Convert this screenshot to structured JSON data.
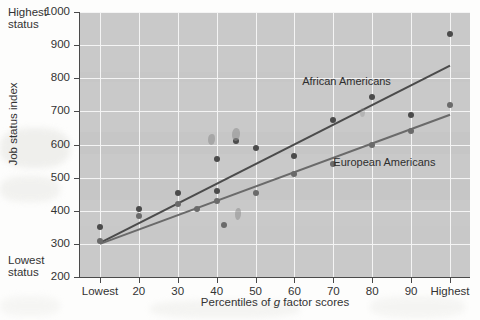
{
  "chart_data": {
    "type": "scatter",
    "title": "",
    "xlabel": "Percentiles of g factor scores",
    "xlabel_plain": "Percentiles of ",
    "xlabel_italic": "g",
    "xlabel_tail": " factor scores",
    "ylabel": "Job status index",
    "y_axis_top_note": "Highest status",
    "y_axis_bottom_note": "Lowest status",
    "y_axis_top_note_line1": "Highest",
    "y_axis_top_note_line2": "status",
    "y_axis_bottom_note_line1": "Lowest",
    "y_axis_bottom_note_line2": "status",
    "ylim": [
      200,
      1000
    ],
    "yticks": [
      200,
      300,
      400,
      500,
      600,
      700,
      800,
      900,
      1000
    ],
    "ytick_labels": [
      "200",
      "300",
      "400",
      "500",
      "600",
      "700",
      "800",
      "900",
      "1000"
    ],
    "categories": [
      "Lowest",
      "20",
      "30",
      "40",
      "50",
      "60",
      "70",
      "80",
      "90",
      "Highest"
    ],
    "xtick_labels": [
      "Lowest",
      "20",
      "30",
      "40",
      "50",
      "60",
      "70",
      "80",
      "90",
      "Highest"
    ],
    "grid": true,
    "grid_color": "#f4f4f4",
    "plot_background": "#c9c9c9",
    "legend_position": "inline-annotations",
    "series": [
      {
        "name": "African Americans",
        "label": "African Americans",
        "color": "#4b4b4b",
        "annotation_x_percentile": 62,
        "annotation_y_value": 790,
        "points": [
          {
            "x": "Lowest",
            "y": 352
          },
          {
            "x": "20",
            "y": 405
          },
          {
            "x": "30",
            "y": 455
          },
          {
            "x": "40",
            "y": 460
          },
          {
            "x": "40",
            "y": 555
          },
          {
            "x": "45",
            "y": 610
          },
          {
            "x": "50",
            "y": 590
          },
          {
            "x": "60",
            "y": 565
          },
          {
            "x": "70",
            "y": 675
          },
          {
            "x": "80",
            "y": 742
          },
          {
            "x": "90",
            "y": 690
          },
          {
            "x": "Highest",
            "y": 935
          }
        ],
        "fit_line": {
          "x_start": "Lowest",
          "y_start": 303,
          "x_end": "Highest",
          "y_end": 838
        }
      },
      {
        "name": "European Americans",
        "label": "European Americans",
        "color": "#6a6a6a",
        "annotation_x_percentile": 70,
        "annotation_y_value": 545,
        "points": [
          {
            "x": "Lowest",
            "y": 310
          },
          {
            "x": "20",
            "y": 385
          },
          {
            "x": "30",
            "y": 420
          },
          {
            "x": "35",
            "y": 405
          },
          {
            "x": "40",
            "y": 430
          },
          {
            "x": "42",
            "y": 358
          },
          {
            "x": "50",
            "y": 455
          },
          {
            "x": "60",
            "y": 510
          },
          {
            "x": "70",
            "y": 540
          },
          {
            "x": "80",
            "y": 600
          },
          {
            "x": "90",
            "y": 640
          },
          {
            "x": "Highest",
            "y": 718
          }
        ],
        "fit_line": {
          "x_start": "Lowest",
          "y_start": 300,
          "x_end": "Highest",
          "y_end": 690
        }
      }
    ]
  },
  "figure": {
    "axis_color": "#4a4a4a",
    "text_color": "#333333"
  }
}
